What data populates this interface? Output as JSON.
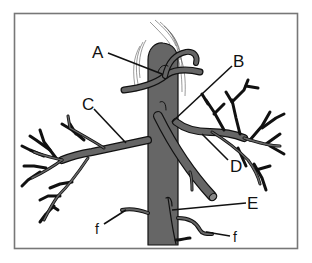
{
  "diagram": {
    "type": "anatomical-illustration",
    "colors": {
      "vessel_fill": "#666666",
      "outline": "#111111",
      "frame": "#777777",
      "background": "#ffffff"
    },
    "labels": [
      {
        "id": "A",
        "text": "A"
      },
      {
        "id": "B",
        "text": "B"
      },
      {
        "id": "C",
        "text": "C"
      },
      {
        "id": "D",
        "text": "D"
      },
      {
        "id": "E",
        "text": "E"
      },
      {
        "id": "f_left",
        "text": "f"
      },
      {
        "id": "f_right",
        "text": "f"
      }
    ]
  }
}
